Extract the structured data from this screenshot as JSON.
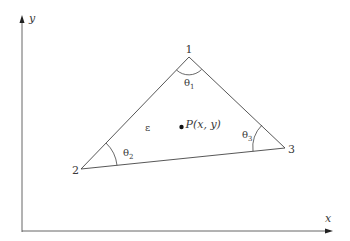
{
  "diagram": {
    "axes": {
      "x_label": "x",
      "y_label": "y"
    },
    "vertices": [
      {
        "id": "1",
        "label": "1",
        "x": 189,
        "y": 57
      },
      {
        "id": "2",
        "label": "2",
        "x": 81,
        "y": 169
      },
      {
        "id": "3",
        "label": "3",
        "x": 285,
        "y": 148
      }
    ],
    "angles": [
      {
        "vertex": "1",
        "symbol": "θ",
        "subscript": "1"
      },
      {
        "vertex": "2",
        "symbol": "θ",
        "subscript": "2"
      },
      {
        "vertex": "3",
        "symbol": "θ",
        "subscript": "3"
      }
    ],
    "element_label": "ε",
    "point": {
      "name": "P",
      "label": "P(x, y)"
    },
    "colors": {
      "line": "#3a3a3a",
      "background": "#ffffff"
    }
  }
}
